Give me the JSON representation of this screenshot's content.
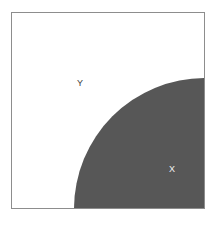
{
  "figure": {
    "name": "set-region-diagram",
    "caption": "",
    "background_color": "#ffffff",
    "border_color": "#8d8d8d",
    "shaded_color": "#575757",
    "unshaded_color": "#ffffff"
  },
  "regions": [
    {
      "id": "y",
      "label": "Y",
      "shape": "square-minus-quarter-disc",
      "fill": "#ffffff",
      "label_color": "#3b3b3b"
    },
    {
      "id": "x",
      "label": "X",
      "shape": "quarter-disc",
      "fill": "#575757",
      "label_color": "#f2f2f2"
    }
  ],
  "chart_data": {
    "type": "diagram",
    "title": "",
    "shapes": [
      {
        "name": "universe-square",
        "kind": "rect",
        "x": 11,
        "y": 12,
        "width": 194,
        "height": 197,
        "fill": "#ffffff",
        "stroke": "#8d8d8d",
        "stroke_width": 1,
        "label": "Y"
      },
      {
        "name": "region-x-quarter-disc",
        "kind": "circle-sector",
        "center_x": 205,
        "center_y": 209,
        "radius": 131,
        "start_angle_deg": 90,
        "end_angle_deg": 180,
        "fill": "#575757",
        "label": "X"
      }
    ],
    "annotations": [
      {
        "text": "Y",
        "x": 68,
        "y": 71,
        "color": "#3b3b3b"
      },
      {
        "text": "X",
        "x": 160,
        "y": 157,
        "color": "#f2f2f2"
      }
    ]
  }
}
